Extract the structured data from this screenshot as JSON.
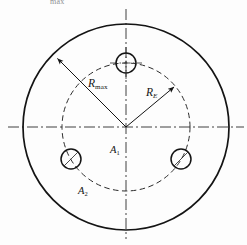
{
  "figure": {
    "caption_fragment": "max",
    "background_color": "#fdfdfd",
    "line_color": "#141414",
    "center": {
      "x": 126,
      "y": 127
    },
    "labels": {
      "r_max": {
        "base": "R",
        "sub": "max"
      },
      "r_e": {
        "base": "R",
        "sub": "E"
      },
      "area_inner": {
        "base": "A",
        "sub": "1"
      },
      "area_outer": {
        "base": "A",
        "sub": "2"
      }
    },
    "outer_circle": {
      "name": "outer-boundary-circle",
      "radius": 103,
      "style": "solid",
      "stroke_width": 1.6
    },
    "dashed_circle": {
      "name": "bolt-pitch-circle",
      "radius": 64,
      "style": "dashed",
      "stroke_width": 1.0
    },
    "centerlines": {
      "style": "dash-dot",
      "horizontal": {
        "x1": 8,
        "x2": 244,
        "y": 127
      },
      "vertical": {
        "y1": 10,
        "y2": 238,
        "x": 126
      }
    },
    "radius_arrows": [
      {
        "name": "r-max-arrow",
        "label": "R_max",
        "angle_deg": 135,
        "length": 103,
        "tip": {
          "x": 53,
          "y": 54
        }
      },
      {
        "name": "r-e-arrow",
        "label": "R_E",
        "angle_deg": 40,
        "length": 64,
        "tip": {
          "x": 175,
          "y": 86
        }
      }
    ],
    "holes": [
      {
        "name": "hole-top",
        "angle_deg": 90,
        "center": {
          "x": 126,
          "y": 63
        },
        "radius": 10,
        "marker": "crosshair"
      },
      {
        "name": "hole-bottom-left",
        "angle_deg": 210,
        "center": {
          "x": 71,
          "y": 159
        },
        "radius": 10,
        "marker": "diagonal"
      },
      {
        "name": "hole-bottom-right",
        "angle_deg": 330,
        "center": {
          "x": 181,
          "y": 159
        },
        "radius": 10,
        "marker": "diagonal"
      }
    ]
  }
}
